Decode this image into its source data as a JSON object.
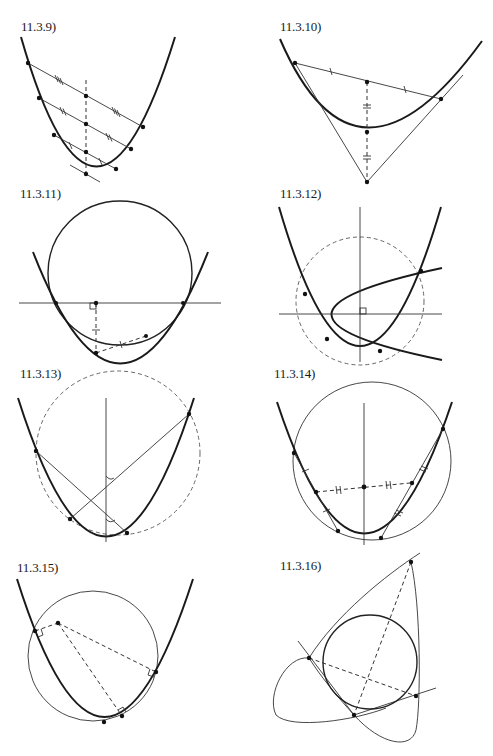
{
  "page": {
    "background": "#ffffff",
    "ink": "#1a1a1a"
  },
  "figures": [
    {
      "id": "11.3.9",
      "label": "11.3.9)",
      "content": "Parabola with three parallel chords; their midpoints lie on a dashed line parallel to the axis; tangent at the bottom point is parallel to the chords"
    },
    {
      "id": "11.3.10",
      "label": "11.3.10)",
      "content": "Parabola with chord; tangents at chord endpoints meet at a point; dashed median from that point through the parabola to the chord midpoint, with equal-segment marks"
    },
    {
      "id": "11.3.11",
      "label": "11.3.11)",
      "content": "Circle intersecting a parabola, horizontal line through two intersection points, right-angle mark, dashed segments"
    },
    {
      "id": "11.3.12",
      "label": "11.3.12)",
      "content": "Two parabolas with perpendicular axes intersecting in four points lying on a dashed circle; right-angle mark at axes crossing"
    },
    {
      "id": "11.3.13",
      "label": "11.3.13)",
      "content": "Parabola with four concyclic points on dashed circle; two chords make equal angles with the axis"
    },
    {
      "id": "11.3.14",
      "label": "11.3.14)",
      "content": "Parabola with circle through four points; chord midpoints joined by dashed line with equal-segment marks to the axis"
    },
    {
      "id": "11.3.15",
      "label": "11.3.15)",
      "content": "Parabola and circle; from an external point three dashed normals with right-angle marks to the parabola"
    },
    {
      "id": "11.3.16",
      "label": "11.3.16)",
      "content": "Ellipse with inscribed circle in a triangle formed by three tangent lines; dashed segments meeting with right angle"
    }
  ]
}
